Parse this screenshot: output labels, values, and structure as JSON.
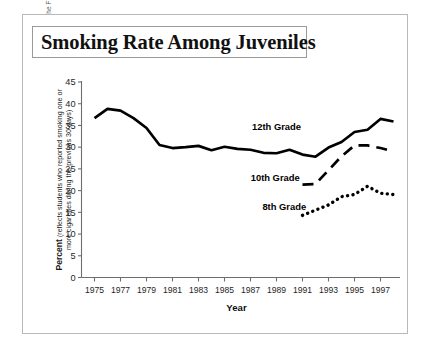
{
  "figure": {
    "title": "Smoking Rate Among Juveniles",
    "source_credit": "Source: Institute for Social Research, University of Michigan, Monitoring the Future Project.",
    "y_caption_bold": "Percent",
    "y_caption_rest": " (reflects students who reported smoking one or more cigarettes during the previous 30 days)",
    "x_axis_title": "Year",
    "frame_color": "#b9b9b9",
    "line_color": "#000000",
    "text_color": "#1a1a1a"
  },
  "chart_data": {
    "type": "line",
    "title": "Smoking Rate Among Juveniles",
    "xlabel": "Year",
    "ylabel": "Percent (reflects students who reported smoking one or more cigarettes during the previous 30 days)",
    "xlim": [
      1974,
      1998.5
    ],
    "ylim": [
      0,
      45
    ],
    "grid": false,
    "legend": "inline-labels",
    "ytick_labels": [
      "0",
      "5",
      "10",
      "15",
      "20",
      "25",
      "30",
      "35",
      "40",
      "45"
    ],
    "yticks": [
      0,
      5,
      10,
      15,
      20,
      25,
      30,
      35,
      40,
      45
    ],
    "xtick_labels": [
      "1975",
      "1977",
      "1979",
      "1981",
      "1983",
      "1985",
      "1987",
      "1989",
      "1991",
      "1993",
      "1995",
      "1997"
    ],
    "xticks": [
      1975,
      1977,
      1979,
      1981,
      1983,
      1985,
      1987,
      1989,
      1991,
      1993,
      1995,
      1997
    ],
    "series": [
      {
        "name": "12th Grade",
        "style": "solid",
        "label_x": 1989.0,
        "label_y": 34.0,
        "x": [
          1975,
          1976,
          1977,
          1978,
          1979,
          1980,
          1981,
          1982,
          1983,
          1984,
          1985,
          1986,
          1987,
          1988,
          1989,
          1990,
          1991,
          1992,
          1993,
          1994,
          1995,
          1996,
          1997,
          1998
        ],
        "y": [
          36.7,
          38.8,
          38.4,
          36.7,
          34.4,
          30.5,
          29.8,
          30.0,
          30.3,
          29.3,
          30.1,
          29.6,
          29.4,
          28.7,
          28.6,
          29.4,
          28.3,
          27.8,
          29.9,
          31.2,
          33.5,
          34.0,
          36.5,
          35.9
        ]
      },
      {
        "name": "10th Grade",
        "style": "dashed",
        "label_x": 1988.9,
        "label_y": 22.3,
        "x": [
          1991,
          1992,
          1993,
          1994,
          1995,
          1996,
          1997,
          1998
        ],
        "y": [
          21.4,
          21.5,
          24.7,
          27.9,
          30.4,
          30.4,
          29.8,
          29.0
        ]
      },
      {
        "name": "8th Grade",
        "style": "dotted",
        "label_x": 1989.6,
        "label_y": 15.5,
        "x": [
          1991,
          1992,
          1993,
          1994,
          1995,
          1996,
          1997,
          1998
        ],
        "y": [
          14.3,
          15.5,
          16.7,
          18.6,
          19.1,
          21.0,
          19.4,
          19.1
        ]
      }
    ]
  }
}
